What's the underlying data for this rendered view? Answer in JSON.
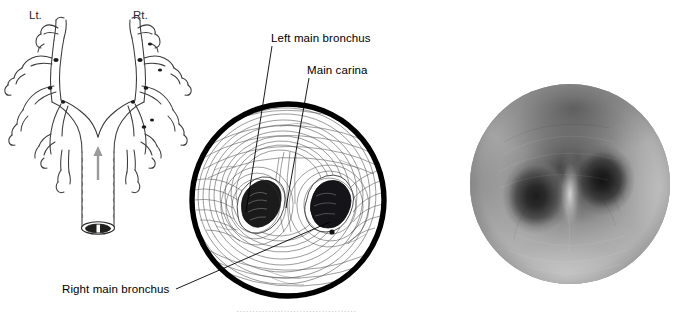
{
  "figure": {
    "panels": [
      {
        "id": "schematic",
        "kind": "line-schematic"
      },
      {
        "id": "drawing",
        "kind": "bronchoscopic-line-drawing"
      },
      {
        "id": "photo",
        "kind": "bronchoscopic-photograph"
      }
    ]
  },
  "tree_panel": {
    "left_side_label": "Lt.",
    "right_side_label": "Rt.",
    "direction_arrow": "up-arrow-icon",
    "arrow_color": "#9a9a9a",
    "trachea_opening": "dark-lumen"
  },
  "drawing_panel": {
    "labels": {
      "left_main_bronchus": "Left main bronchus",
      "main_carina": "Main carina",
      "right_main_bronchus": "Right main bronchus"
    },
    "rim_color": "#000000",
    "line_color": "#3a3a3a"
  },
  "photo_panel": {
    "description": "Grayscale endoscopic view of main carina",
    "tone_dark": "#1a1a1a",
    "tone_mid": "#8e8e8e",
    "tone_light": "#c8c8c8"
  },
  "caption": {
    "clipped_text": "······································"
  }
}
